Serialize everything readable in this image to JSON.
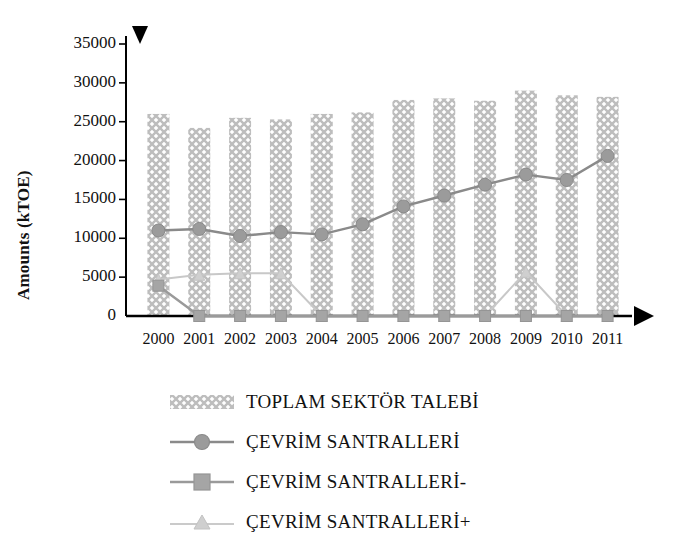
{
  "chart_data": {
    "type": "bar",
    "title": "",
    "xlabel": "",
    "ylabel": "Amounts  (kTOE)",
    "categories": [
      "2000",
      "2001",
      "2002",
      "2003",
      "2004",
      "2005",
      "2006",
      "2007",
      "2008",
      "2009",
      "2010",
      "2011"
    ],
    "ylim": [
      0,
      35000
    ],
    "yticks": [
      0,
      5000,
      10000,
      15000,
      20000,
      25000,
      30000,
      35000
    ],
    "ytick_labels": [
      "0",
      "5000",
      "10000",
      "15000",
      "20000",
      "25000",
      "30000",
      "35000"
    ],
    "grid": false,
    "legend_position": "below",
    "series": [
      {
        "name": "TOPLAM SEKTÖR TALEBİ",
        "type": "bar",
        "marker": "hatched-bar",
        "color": "#b9b9b9",
        "values": [
          26000,
          24200,
          25500,
          25300,
          26000,
          26200,
          27800,
          28000,
          27700,
          29000,
          28400,
          28200
        ]
      },
      {
        "name": "ÇEVRİM SANTRALLERİ",
        "type": "line",
        "marker": "circle",
        "color": "#8a8a8a",
        "values": [
          11000,
          11200,
          10300,
          10800,
          10500,
          11800,
          14100,
          15500,
          16900,
          18200,
          17500,
          20600
        ]
      },
      {
        "name": "ÇEVRİM SANTRALLERİ-",
        "type": "line",
        "marker": "square",
        "color": "#9a9a9a",
        "values": [
          3900,
          0,
          0,
          0,
          0,
          0,
          0,
          0,
          0,
          0,
          0,
          0
        ]
      },
      {
        "name": "ÇEVRİM SANTRALLERİ+",
        "type": "line",
        "marker": "triangle",
        "color": "#c8c8c8",
        "values": [
          4700,
          5300,
          5500,
          5500,
          0,
          0,
          0,
          0,
          0,
          5700,
          0,
          0
        ]
      }
    ],
    "axis_decorations": {
      "y_axis_top_marker": "down-triangle",
      "x_axis_end_marker": "right-triangle"
    }
  },
  "legend": {
    "items": [
      {
        "label": "TOPLAM SEKTÖR TALEBİ",
        "marker": "hatched-bar"
      },
      {
        "label": "ÇEVRİM SANTRALLERİ",
        "marker": "circle"
      },
      {
        "label": "ÇEVRİM SANTRALLERİ-",
        "marker": "square"
      },
      {
        "label": "ÇEVRİM SANTRALLERİ+",
        "marker": "triangle"
      }
    ]
  }
}
